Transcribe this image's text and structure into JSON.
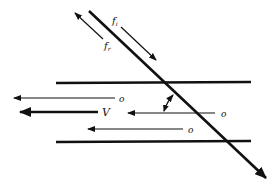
{
  "diagram": {
    "labels": {
      "incident_freq": "f",
      "incident_sub": "i",
      "reflected_freq": "f",
      "reflected_sub": "r",
      "velocity": "V",
      "scatterer_1": "o",
      "scatterer_2": "o",
      "scatterer_3": "o"
    },
    "colors": {
      "stroke": "#111111",
      "background": "#ffffff"
    }
  }
}
